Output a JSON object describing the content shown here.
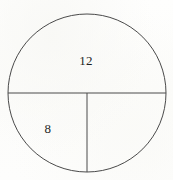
{
  "figure": {
    "name": "circle-with-diameter-and-radius",
    "background_color": "#fdfdfc",
    "stroke_color": "#4a4a4a",
    "text_color": "#1f1f1f",
    "canvas": {
      "width": 173,
      "height": 180
    }
  },
  "circle": {
    "center_x": 87,
    "center_y": 93,
    "radius": 79,
    "stroke_width": 1
  },
  "segments": [
    {
      "name": "horizontal-diameter",
      "x1": 8,
      "y1": 93,
      "x2": 166,
      "y2": 93,
      "stroke_width": 1
    },
    {
      "name": "vertical-radius",
      "x1": 87,
      "y1": 93,
      "x2": 87,
      "y2": 172,
      "stroke_width": 1
    }
  ],
  "labels": [
    {
      "name": "upper-semicircle-label",
      "text": "12",
      "x": 86,
      "y": 60,
      "region": "upper semicircle"
    },
    {
      "name": "lower-left-quadrant-label",
      "text": "8",
      "x": 48,
      "y": 128,
      "region": "lower left quadrant"
    }
  ]
}
